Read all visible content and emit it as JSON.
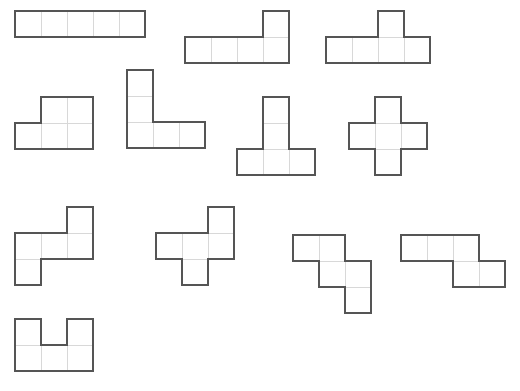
{
  "page": {
    "background_color": "#ffffff",
    "width": 520,
    "height": 391,
    "cell_size": 26,
    "outline_color": "#555555",
    "grid_line_color": "#d8d8d8",
    "cell_fill_color": "#ffffff",
    "shape_count": 12,
    "cells_per_shape": 5
  },
  "shapes": [
    {
      "id": "shape-i-pentomino",
      "name": "I-pentomino",
      "label": "I",
      "x": 14,
      "y": 10,
      "cols": 5,
      "rows": 1,
      "cells": [
        [
          0,
          0
        ],
        [
          1,
          0
        ],
        [
          2,
          0
        ],
        [
          3,
          0
        ],
        [
          4,
          0
        ]
      ]
    },
    {
      "id": "shape-l-pentomino",
      "name": "L-pentomino",
      "label": "L",
      "x": 184,
      "y": 10,
      "cols": 4,
      "rows": 2,
      "cells": [
        [
          3,
          0
        ],
        [
          0,
          1
        ],
        [
          1,
          1
        ],
        [
          2,
          1
        ],
        [
          3,
          1
        ]
      ]
    },
    {
      "id": "shape-y-pentomino",
      "name": "Y-pentomino",
      "label": "Y",
      "x": 325,
      "y": 10,
      "cols": 4,
      "rows": 2,
      "cells": [
        [
          2,
          0
        ],
        [
          0,
          1
        ],
        [
          1,
          1
        ],
        [
          2,
          1
        ],
        [
          3,
          1
        ]
      ]
    },
    {
      "id": "shape-p-pentomino",
      "name": "P-pentomino",
      "label": "P",
      "x": 14,
      "y": 96,
      "cols": 3,
      "rows": 2,
      "cells": [
        [
          1,
          0
        ],
        [
          2,
          0
        ],
        [
          0,
          1
        ],
        [
          1,
          1
        ],
        [
          2,
          1
        ]
      ]
    },
    {
      "id": "shape-v-pentomino",
      "name": "V-pentomino",
      "label": "V",
      "x": 126,
      "y": 69,
      "cols": 3,
      "rows": 3,
      "cells": [
        [
          0,
          0
        ],
        [
          0,
          1
        ],
        [
          0,
          2
        ],
        [
          1,
          2
        ],
        [
          2,
          2
        ]
      ]
    },
    {
      "id": "shape-t-pentomino",
      "name": "T-pentomino",
      "label": "T",
      "x": 236,
      "y": 96,
      "cols": 3,
      "rows": 3,
      "cells": [
        [
          1,
          0
        ],
        [
          1,
          1
        ],
        [
          0,
          2
        ],
        [
          1,
          2
        ],
        [
          2,
          2
        ]
      ]
    },
    {
      "id": "shape-x-pentomino",
      "name": "X-pentomino",
      "label": "X",
      "x": 348,
      "y": 96,
      "cols": 3,
      "rows": 3,
      "cells": [
        [
          1,
          0
        ],
        [
          0,
          1
        ],
        [
          1,
          1
        ],
        [
          2,
          1
        ],
        [
          1,
          2
        ]
      ]
    },
    {
      "id": "shape-s-pentomino",
      "name": "S-pentomino",
      "label": "S",
      "x": 14,
      "y": 206,
      "cols": 3,
      "rows": 3,
      "cells": [
        [
          2,
          0
        ],
        [
          0,
          1
        ],
        [
          1,
          1
        ],
        [
          2,
          1
        ],
        [
          0,
          2
        ]
      ]
    },
    {
      "id": "shape-f-pentomino",
      "name": "F-pentomino",
      "label": "F",
      "x": 155,
      "y": 206,
      "cols": 3,
      "rows": 3,
      "cells": [
        [
          2,
          0
        ],
        [
          0,
          1
        ],
        [
          1,
          1
        ],
        [
          2,
          1
        ],
        [
          1,
          2
        ]
      ]
    },
    {
      "id": "shape-w-pentomino",
      "name": "W-pentomino",
      "label": "W",
      "x": 292,
      "y": 234,
      "cols": 3,
      "rows": 3,
      "cells": [
        [
          0,
          0
        ],
        [
          1,
          0
        ],
        [
          1,
          1
        ],
        [
          2,
          1
        ],
        [
          2,
          2
        ]
      ]
    },
    {
      "id": "shape-n-pentomino",
      "name": "N-pentomino",
      "label": "N",
      "x": 400,
      "y": 234,
      "cols": 4,
      "rows": 2,
      "cells": [
        [
          0,
          0
        ],
        [
          1,
          0
        ],
        [
          2,
          0
        ],
        [
          2,
          1
        ],
        [
          3,
          1
        ]
      ]
    },
    {
      "id": "shape-u-pentomino",
      "name": "U-pentomino",
      "label": "U",
      "x": 14,
      "y": 318,
      "cols": 3,
      "rows": 2,
      "cells": [
        [
          0,
          0
        ],
        [
          2,
          0
        ],
        [
          0,
          1
        ],
        [
          1,
          1
        ],
        [
          2,
          1
        ]
      ]
    }
  ]
}
